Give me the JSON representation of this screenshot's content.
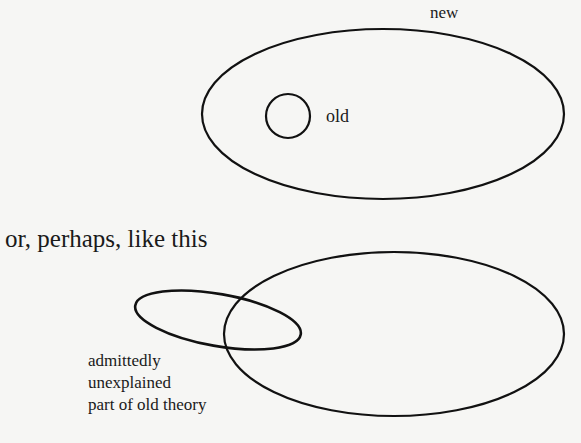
{
  "diagram_top": {
    "outer_label": "new",
    "inner_label": "old"
  },
  "heading": "or, perhaps, like this",
  "diagram_bottom": {
    "note_lines": [
      "admittedly",
      "unexplained",
      "part of old theory"
    ]
  },
  "colors": {
    "stroke": "#111111",
    "background": "#f6f6f4",
    "text": "#1a1a1a"
  }
}
